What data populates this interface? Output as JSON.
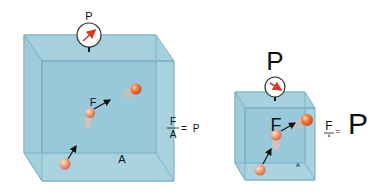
{
  "diagram": {
    "left": {
      "gauge_label": "P",
      "force_label": "F",
      "area_label": "A",
      "equation": {
        "numerator": "F",
        "denominator": "A",
        "equals": "=",
        "result": "P"
      }
    },
    "right": {
      "gauge_label": "P",
      "force_label": "F",
      "area_label": "A",
      "equation": {
        "numerator": "F",
        "denominator": "A",
        "equals": "=",
        "result": "P"
      }
    },
    "colors": {
      "box_face": "#a9d3e0",
      "box_edge": "#6fa9bd",
      "particle": "#e8774a",
      "gauge_needle": "#d9382a"
    }
  }
}
